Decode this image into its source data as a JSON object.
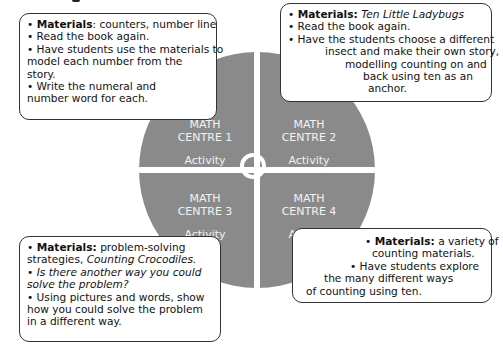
{
  "diagram": {
    "colors": {
      "circle": "#8a8a8a",
      "label_text": "#f2f2f2",
      "box_border": "#333333"
    },
    "centres": [
      {
        "title_line1": "MATH",
        "title_line2": "CENTRE 1",
        "activity": "Activity"
      },
      {
        "title_line1": "MATH",
        "title_line2": "CENTRE 2",
        "activity": "Activity"
      },
      {
        "title_line1": "MATH",
        "title_line2": "CENTRE 3",
        "activity": "Activity"
      },
      {
        "title_line1": "MATH",
        "title_line2": "CENTRE 4",
        "activity": "Activity"
      }
    ],
    "boxes": {
      "centre1": {
        "materials_label": "Materials",
        "materials_value": ": counters, number line",
        "lines": [
          "• Read the book again.",
          "• Have students use the materials to",
          "model each number from the",
          "story.",
          "• Write the numeral  and",
          "number word for each."
        ]
      },
      "centre2": {
        "materials_label": "Materials:",
        "materials_value": "Ten Little Ladybugs",
        "lines": [
          "• Read the book again.",
          "• Have the students choose a different",
          "insect and make their own story,",
          "modelling counting on and",
          "back using ten as an",
          "anchor."
        ]
      },
      "centre3": {
        "materials_label": "Materials:",
        "materials_value": "problem-solving",
        "materials_line2_plain": "strategies, ",
        "materials_line2_italic": "Counting Crocodiles.",
        "question_line1": "Is there another way you could",
        "question_line2": "solve the problem?",
        "lines": [
          "• Using pictures and words, show",
          "how you could solve the problem",
          "in a different way."
        ]
      },
      "centre4": {
        "materials_label": "Materials:",
        "materials_value": "a variety of",
        "lines": [
          "counting materials.",
          "• Have students explore",
          "the many different ways",
          "of counting using ten."
        ]
      }
    }
  }
}
